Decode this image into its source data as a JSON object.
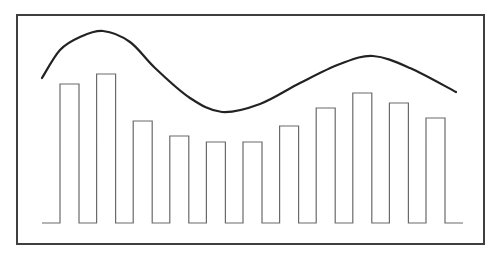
{
  "chart_data": {
    "type": "bar",
    "title": "",
    "xlabel": "",
    "ylabel": "",
    "grid": false,
    "legend": null,
    "categories": [
      "1",
      "2",
      "3",
      "4",
      "5",
      "6",
      "7",
      "8",
      "9",
      "10",
      "11"
    ],
    "series": [
      {
        "name": "bars",
        "type": "bar",
        "values": [
          139,
          149,
          102,
          87,
          81,
          81,
          97,
          115,
          130,
          120,
          105
        ]
      },
      {
        "name": "trend",
        "type": "line",
        "smooth": true,
        "points": [
          [
            42,
            78
          ],
          [
            60,
            50
          ],
          [
            80,
            37
          ],
          [
            103,
            31
          ],
          [
            130,
            42
          ],
          [
            155,
            68
          ],
          [
            190,
            98
          ],
          [
            222,
            112
          ],
          [
            260,
            104
          ],
          [
            300,
            83
          ],
          [
            340,
            64
          ],
          [
            373,
            56
          ],
          [
            410,
            68
          ],
          [
            456,
            92
          ]
        ]
      }
    ],
    "ylim": [
      0,
      160
    ]
  },
  "colors": {
    "frame": "#3f3f3f",
    "bars": "#6a6a6a",
    "trend": "#222222",
    "background": "#ffffff"
  },
  "layout": {
    "frame": {
      "x": 17,
      "y": 15,
      "width": 467,
      "height": 229
    },
    "baseline_y": 223,
    "baseline_start_x": 42,
    "baseline_end_x": 463,
    "bar_first_left": 60,
    "bar_stride": 36.6,
    "bar_width": 19
  }
}
